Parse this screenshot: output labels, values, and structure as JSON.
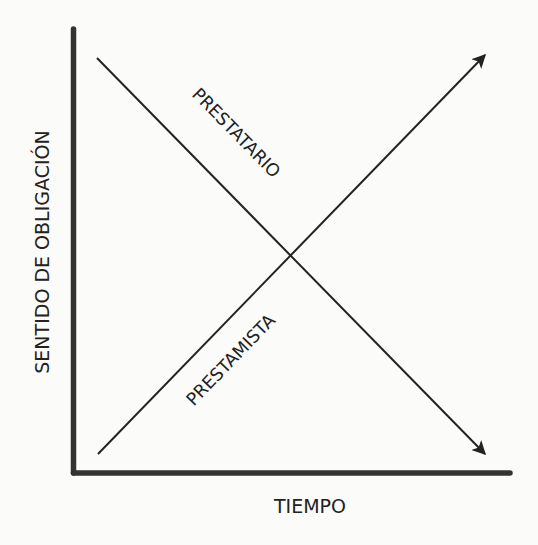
{
  "diagram": {
    "title": "",
    "y_axis_label": "SENTIDO DE OBLIGACIÓN",
    "x_axis_label": "TIEMPO",
    "lines": [
      {
        "id": "prestatario",
        "label": "PRESTATARIO",
        "direction": "descending",
        "arrow": "end"
      },
      {
        "id": "prestamista",
        "label": "PRESTAMISTA",
        "direction": "ascending",
        "arrow": "end"
      }
    ],
    "colors": {
      "ink": "#222222",
      "axis": "#333333",
      "background": "#fbfbfa"
    }
  }
}
